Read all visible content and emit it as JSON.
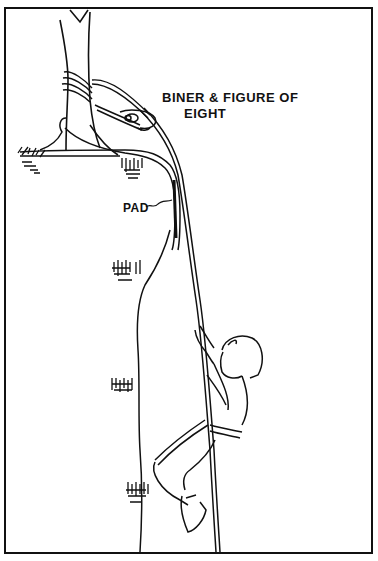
{
  "figure": {
    "type": "line-drawing",
    "labels": {
      "biner_line1": "BINER & FIGURE OF",
      "biner_line2": "EIGHT",
      "pad": "PAD"
    },
    "colors": {
      "ink": "#111111",
      "paper": "#ffffff"
    }
  }
}
